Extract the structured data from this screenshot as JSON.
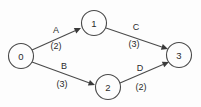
{
  "figure": {
    "background_color": "#fdfdfd",
    "stroke_color": "#4a4a4a",
    "text_color": "#2b2b2b",
    "width": 201,
    "height": 107
  },
  "graph": {
    "type": "directed-weighted-graph",
    "nodes": [
      {
        "id": "0",
        "label": "0",
        "cx": 21,
        "cy": 56,
        "r": 12.5
      },
      {
        "id": "1",
        "label": "1",
        "cx": 94,
        "cy": 23,
        "r": 12.5
      },
      {
        "id": "2",
        "label": "2",
        "cx": 108,
        "cy": 87,
        "r": 12.5
      },
      {
        "id": "3",
        "label": "3",
        "cx": 179,
        "cy": 55,
        "r": 12.5
      }
    ],
    "edges": [
      {
        "id": "A",
        "name": "A",
        "weight": "(2)",
        "from": "0",
        "to": "1",
        "x1": 32,
        "y1": 50,
        "x2": 81,
        "y2": 28,
        "name_x": 56,
        "name_y": 30,
        "weight_x": 56,
        "weight_y": 46
      },
      {
        "id": "C",
        "name": "C",
        "weight": "(3)",
        "from": "1",
        "to": "3",
        "x1": 106,
        "y1": 28,
        "x2": 168,
        "y2": 49,
        "name_x": 136,
        "name_y": 27,
        "weight_x": 134,
        "weight_y": 44
      },
      {
        "id": "B",
        "name": "B",
        "weight": "(3)",
        "from": "0",
        "to": "2",
        "x1": 32,
        "y1": 62,
        "x2": 95,
        "y2": 85,
        "name_x": 64,
        "name_y": 66,
        "weight_x": 62,
        "weight_y": 84
      },
      {
        "id": "D",
        "name": "D",
        "weight": "(2)",
        "from": "2",
        "to": "3",
        "x1": 120,
        "y1": 83,
        "x2": 169,
        "y2": 62,
        "name_x": 140,
        "name_y": 68,
        "weight_x": 141,
        "weight_y": 87
      }
    ]
  }
}
